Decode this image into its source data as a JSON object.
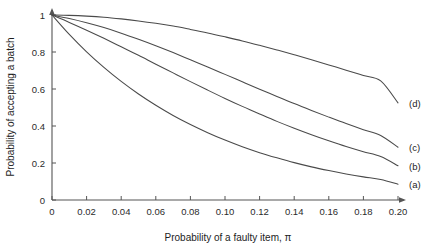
{
  "chart_data": {
    "type": "line",
    "title": "",
    "subtitle": "",
    "xlabel": "Probability of a faulty item, π",
    "ylabel": "Probability of accepting a batch",
    "xlim": [
      0,
      0.2
    ],
    "ylim": [
      0,
      1
    ],
    "grid": false,
    "legend_position": "right-end-of-curve-labels",
    "x_ticks": [
      0,
      0.02,
      0.04,
      0.06,
      0.08,
      0.1,
      0.12,
      0.14,
      0.16,
      0.18,
      0.2
    ],
    "x_tick_labels": [
      "0",
      "0.02",
      "0.04",
      "0.06",
      "0.08",
      "0.10",
      "0.12",
      "0.14",
      "0.16",
      "0.18",
      "0.20"
    ],
    "y_ticks": [
      0,
      0.2,
      0.4,
      0.6,
      0.8,
      1
    ],
    "y_tick_labels": [
      "0",
      "0.2",
      "0.4",
      "0.6",
      "0.8",
      "1"
    ],
    "x": [
      0,
      0.01,
      0.02,
      0.03,
      0.04,
      0.05,
      0.06,
      0.07,
      0.08,
      0.09,
      0.1,
      0.11,
      0.12,
      0.13,
      0.14,
      0.15,
      0.16,
      0.17,
      0.18,
      0.19,
      0.2
    ],
    "series": [
      {
        "name": "(a)",
        "label": "(a)",
        "color": "#4a4a4a",
        "values": [
          1.0,
          0.895,
          0.801,
          0.717,
          0.641,
          0.573,
          0.512,
          0.457,
          0.408,
          0.364,
          0.324,
          0.288,
          0.256,
          0.228,
          0.202,
          0.179,
          0.159,
          0.141,
          0.125,
          0.111,
          0.085
        ]
      },
      {
        "name": "(b)",
        "label": "(b)",
        "color": "#4a4a4a",
        "values": [
          1.0,
          0.96,
          0.918,
          0.874,
          0.828,
          0.782,
          0.734,
          0.687,
          0.64,
          0.594,
          0.549,
          0.506,
          0.465,
          0.425,
          0.388,
          0.353,
          0.32,
          0.289,
          0.261,
          0.235,
          0.185
        ]
      },
      {
        "name": "(c)",
        "label": "(c)",
        "color": "#4a4a4a",
        "values": [
          1.0,
          0.981,
          0.958,
          0.932,
          0.902,
          0.869,
          0.834,
          0.797,
          0.758,
          0.719,
          0.679,
          0.639,
          0.599,
          0.56,
          0.521,
          0.484,
          0.448,
          0.413,
          0.38,
          0.349,
          0.285
        ]
      },
      {
        "name": "(d)",
        "label": "(d)",
        "color": "#4a4a4a",
        "values": [
          1.0,
          0.998,
          0.994,
          0.988,
          0.979,
          0.968,
          0.955,
          0.94,
          0.922,
          0.903,
          0.882,
          0.86,
          0.836,
          0.811,
          0.785,
          0.758,
          0.73,
          0.702,
          0.673,
          0.644,
          0.525
        ]
      }
    ],
    "curve_labels": [
      {
        "text": "(d)",
        "x": 0.2,
        "y": 0.525
      },
      {
        "text": "(c)",
        "x": 0.2,
        "y": 0.285
      },
      {
        "text": "(b)",
        "x": 0.2,
        "y": 0.185
      },
      {
        "text": "(a)",
        "x": 0.2,
        "y": 0.085
      }
    ]
  },
  "axes": {
    "x_title": "Probability of a faulty item, π",
    "y_title": "Probability of accepting a batch"
  },
  "colors": {
    "curve": "#4a4a4a",
    "axis": "#555555",
    "text": "#1d1d1d",
    "background": "#ffffff"
  }
}
